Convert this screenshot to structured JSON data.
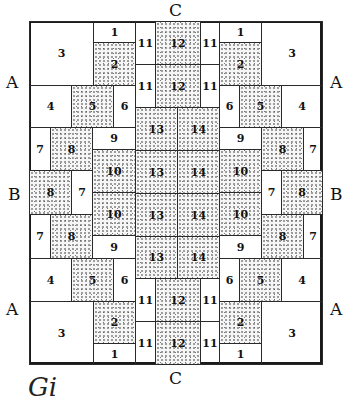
{
  "labels": {
    "top": "C",
    "bottom": "C",
    "left_upper": "A",
    "left_middle": "B",
    "left_lower": "A",
    "right_upper": "A",
    "right_middle": "B",
    "right_lower": "A"
  },
  "caption": "Gi",
  "cells": [
    {
      "n": "3",
      "x": 0,
      "y": 0,
      "w": 64,
      "h": 64,
      "dot": false
    },
    {
      "n": "1",
      "x": 64,
      "y": 0,
      "w": 42,
      "h": 21,
      "dot": false
    },
    {
      "n": "2",
      "x": 64,
      "y": 21,
      "w": 42,
      "h": 43,
      "dot": true
    },
    {
      "n": "4",
      "x": 0,
      "y": 64,
      "w": 42,
      "h": 42,
      "dot": false
    },
    {
      "n": "5",
      "x": 42,
      "y": 64,
      "w": 42,
      "h": 42,
      "dot": true
    },
    {
      "n": "6",
      "x": 84,
      "y": 64,
      "w": 22,
      "h": 42,
      "dot": false
    },
    {
      "n": "7",
      "x": 0,
      "y": 106,
      "w": 21,
      "h": 43,
      "dot": false
    },
    {
      "n": "8",
      "x": 21,
      "y": 106,
      "w": 42,
      "h": 43,
      "dot": true
    },
    {
      "n": "9",
      "x": 63,
      "y": 106,
      "w": 43,
      "h": 22,
      "dot": false
    },
    {
      "n": "10",
      "x": 63,
      "y": 128,
      "w": 43,
      "h": 43,
      "dot": true
    },
    {
      "n": "8",
      "x": 0,
      "y": 149,
      "w": 42,
      "h": 44,
      "dot": true
    },
    {
      "n": "7",
      "x": 42,
      "y": 149,
      "w": 21,
      "h": 44,
      "dot": false
    },
    {
      "n": "10",
      "x": 63,
      "y": 171,
      "w": 43,
      "h": 43,
      "dot": true
    },
    {
      "n": "7",
      "x": 0,
      "y": 193,
      "w": 21,
      "h": 44,
      "dot": false
    },
    {
      "n": "8",
      "x": 21,
      "y": 193,
      "w": 42,
      "h": 44,
      "dot": true
    },
    {
      "n": "9",
      "x": 63,
      "y": 214,
      "w": 43,
      "h": 23,
      "dot": false
    },
    {
      "n": "4",
      "x": 0,
      "y": 237,
      "w": 42,
      "h": 43,
      "dot": false
    },
    {
      "n": "5",
      "x": 42,
      "y": 237,
      "w": 42,
      "h": 43,
      "dot": true
    },
    {
      "n": "6",
      "x": 84,
      "y": 237,
      "w": 22,
      "h": 43,
      "dot": false
    },
    {
      "n": "3",
      "x": 0,
      "y": 280,
      "w": 64,
      "h": 63,
      "dot": false
    },
    {
      "n": "2",
      "x": 64,
      "y": 280,
      "w": 42,
      "h": 42,
      "dot": true
    },
    {
      "n": "1",
      "x": 64,
      "y": 322,
      "w": 42,
      "h": 21,
      "dot": false
    },
    {
      "n": "11",
      "x": 106,
      "y": 0,
      "w": 20,
      "h": 43,
      "dot": false
    },
    {
      "n": "12",
      "x": 126,
      "y": 0,
      "w": 45,
      "h": 43,
      "dot": true
    },
    {
      "n": "11",
      "x": 171,
      "y": 0,
      "w": 19,
      "h": 43,
      "dot": false
    },
    {
      "n": "11",
      "x": 106,
      "y": 43,
      "w": 20,
      "h": 43,
      "dot": false
    },
    {
      "n": "12",
      "x": 126,
      "y": 43,
      "w": 45,
      "h": 43,
      "dot": true
    },
    {
      "n": "11",
      "x": 171,
      "y": 43,
      "w": 19,
      "h": 43,
      "dot": false
    },
    {
      "n": "13",
      "x": 106,
      "y": 86,
      "w": 42,
      "h": 43,
      "dot": true
    },
    {
      "n": "14",
      "x": 148,
      "y": 86,
      "w": 42,
      "h": 43,
      "dot": true
    },
    {
      "n": "13",
      "x": 106,
      "y": 129,
      "w": 42,
      "h": 43,
      "dot": true
    },
    {
      "n": "14",
      "x": 148,
      "y": 129,
      "w": 42,
      "h": 43,
      "dot": true
    },
    {
      "n": "13",
      "x": 106,
      "y": 172,
      "w": 42,
      "h": 43,
      "dot": true
    },
    {
      "n": "14",
      "x": 148,
      "y": 172,
      "w": 42,
      "h": 43,
      "dot": true
    },
    {
      "n": "13",
      "x": 106,
      "y": 215,
      "w": 42,
      "h": 42,
      "dot": true
    },
    {
      "n": "14",
      "x": 148,
      "y": 215,
      "w": 42,
      "h": 42,
      "dot": true
    },
    {
      "n": "11",
      "x": 106,
      "y": 257,
      "w": 20,
      "h": 43,
      "dot": false
    },
    {
      "n": "12",
      "x": 126,
      "y": 257,
      "w": 45,
      "h": 43,
      "dot": true
    },
    {
      "n": "11",
      "x": 171,
      "y": 257,
      "w": 19,
      "h": 43,
      "dot": false
    },
    {
      "n": "11",
      "x": 106,
      "y": 300,
      "w": 20,
      "h": 43,
      "dot": false
    },
    {
      "n": "12",
      "x": 126,
      "y": 300,
      "w": 45,
      "h": 43,
      "dot": true
    },
    {
      "n": "11",
      "x": 171,
      "y": 300,
      "w": 19,
      "h": 43,
      "dot": false
    },
    {
      "n": "1",
      "x": 190,
      "y": 0,
      "w": 42,
      "h": 21,
      "dot": false
    },
    {
      "n": "3",
      "x": 232,
      "y": 0,
      "w": 61,
      "h": 64,
      "dot": false
    },
    {
      "n": "2",
      "x": 190,
      "y": 21,
      "w": 42,
      "h": 43,
      "dot": true
    },
    {
      "n": "6",
      "x": 190,
      "y": 64,
      "w": 20,
      "h": 42,
      "dot": false
    },
    {
      "n": "5",
      "x": 210,
      "y": 64,
      "w": 42,
      "h": 42,
      "dot": true
    },
    {
      "n": "4",
      "x": 252,
      "y": 64,
      "w": 41,
      "h": 42,
      "dot": false
    },
    {
      "n": "9",
      "x": 190,
      "y": 106,
      "w": 42,
      "h": 22,
      "dot": false
    },
    {
      "n": "8",
      "x": 232,
      "y": 106,
      "w": 42,
      "h": 43,
      "dot": true
    },
    {
      "n": "7",
      "x": 274,
      "y": 106,
      "w": 19,
      "h": 43,
      "dot": false
    },
    {
      "n": "10",
      "x": 190,
      "y": 128,
      "w": 42,
      "h": 43,
      "dot": true
    },
    {
      "n": "7",
      "x": 232,
      "y": 149,
      "w": 20,
      "h": 44,
      "dot": false
    },
    {
      "n": "8",
      "x": 252,
      "y": 149,
      "w": 41,
      "h": 44,
      "dot": true
    },
    {
      "n": "10",
      "x": 190,
      "y": 171,
      "w": 42,
      "h": 43,
      "dot": true
    },
    {
      "n": "8",
      "x": 232,
      "y": 193,
      "w": 42,
      "h": 44,
      "dot": true
    },
    {
      "n": "7",
      "x": 274,
      "y": 193,
      "w": 19,
      "h": 44,
      "dot": false
    },
    {
      "n": "9",
      "x": 190,
      "y": 214,
      "w": 42,
      "h": 23,
      "dot": false
    },
    {
      "n": "6",
      "x": 190,
      "y": 237,
      "w": 20,
      "h": 43,
      "dot": false
    },
    {
      "n": "5",
      "x": 210,
      "y": 237,
      "w": 42,
      "h": 43,
      "dot": true
    },
    {
      "n": "4",
      "x": 252,
      "y": 237,
      "w": 41,
      "h": 43,
      "dot": false
    },
    {
      "n": "2",
      "x": 190,
      "y": 280,
      "w": 42,
      "h": 42,
      "dot": true
    },
    {
      "n": "3",
      "x": 232,
      "y": 280,
      "w": 61,
      "h": 63,
      "dot": false
    },
    {
      "n": "1",
      "x": 190,
      "y": 322,
      "w": 42,
      "h": 21,
      "dot": false
    }
  ]
}
